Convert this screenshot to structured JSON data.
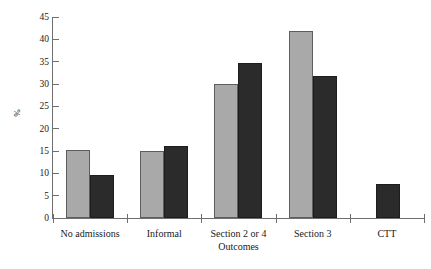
{
  "chart_data": {
    "type": "bar",
    "title": "",
    "subtitle": "",
    "xlabel": "Outcomes",
    "ylabel": "%",
    "ylim": [
      0,
      45
    ],
    "yticks": [
      0,
      5,
      10,
      15,
      20,
      25,
      30,
      35,
      40,
      45
    ],
    "ytick_labels": [
      "0",
      "5",
      "10",
      "15",
      "20",
      "25",
      "30",
      "35",
      "40",
      "45"
    ],
    "grid": false,
    "legend": "none",
    "categories": [
      "No admissions",
      "Informal",
      "Section 2 or 4",
      "Section 3",
      "CTT"
    ],
    "series": [
      {
        "name": "series-light",
        "color": "#a9a9a9",
        "values": [
          15.2,
          15.0,
          30.0,
          41.9,
          0
        ]
      },
      {
        "name": "series-dark",
        "color": "#2b2b2b",
        "values": [
          9.7,
          16.2,
          34.6,
          31.7,
          7.6
        ]
      }
    ],
    "annotations": []
  },
  "axis": {
    "y_title": "%",
    "x_title": "Outcomes"
  },
  "colors": {
    "light_bar": "#a9a9a9",
    "dark_bar": "#2b2b2b",
    "axis": "#6f6f6f",
    "text": "#1a1a1a",
    "background": "#ffffff"
  }
}
